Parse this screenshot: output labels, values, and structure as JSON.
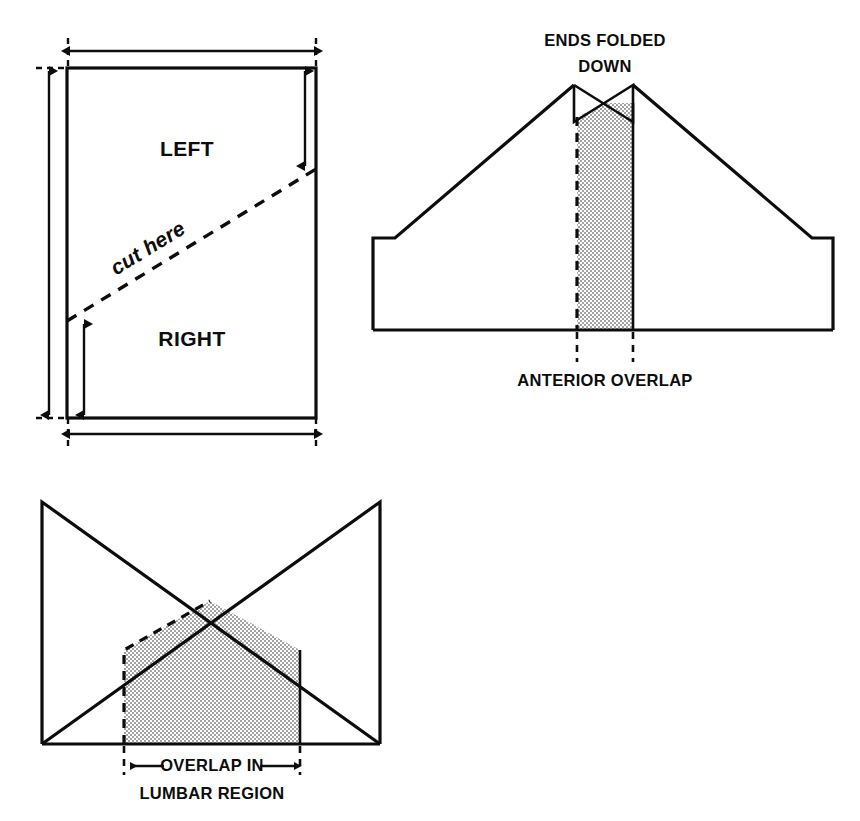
{
  "figure": {
    "background_color": "#ffffff",
    "ink_color": "#0d0d0d",
    "stipple_color": "#c9c9c9"
  },
  "panels": [
    {
      "id": "panel-sheet",
      "name": "rectangular-sheet-with-diagonal-cut",
      "labels": {
        "left": "LEFT",
        "right": "RIGHT",
        "cut": "cut here"
      },
      "dimensions": {
        "top_width_arrow": "double-headed horizontal arrow across top",
        "bottom_width_arrow": "double-headed horizontal arrow across bottom",
        "left_height_arrow": "double-headed vertical arrow full height",
        "left_short_arrow": "double-headed vertical arrow lower left",
        "right_short_arrow": "double-headed vertical arrow upper right"
      },
      "geometry": {
        "rect_left": 67,
        "rect_top": 68,
        "rect_right": 316,
        "rect_bottom": 418,
        "cut_start_x": 67,
        "cut_start_y": 321,
        "cut_end_x": 316,
        "cut_end_y": 169
      }
    },
    {
      "id": "panel-anterior",
      "name": "anterior-view-ends-folded-down",
      "labels": {
        "top": "ENDS FOLDED",
        "top_line2": "DOWN",
        "bottom": "ANTERIOR OVERLAP"
      },
      "geometry": {
        "body_left": 373,
        "body_right": 833,
        "body_bottom": 330,
        "shoulder_y": 238,
        "shoulder_left_x": 395,
        "shoulder_right_x": 812,
        "apex_left_x": 574,
        "apex_right_x": 633,
        "bowtie_top_y": 85,
        "bowtie_cross_y": 103,
        "bowtie_bottom_y": 122,
        "overlap_left_x": 577,
        "overlap_right_x": 633
      }
    },
    {
      "id": "panel-lumbar",
      "name": "posterior-view-overlap-in-lumbar-region",
      "labels": {
        "bottom_line1": "OVERLAP IN",
        "bottom_line2": "LUMBAR REGION"
      },
      "geometry": {
        "body_left": 42,
        "body_right": 380,
        "body_bottom": 744,
        "top_y": 502,
        "cross_x": 210,
        "cross_y": 601,
        "overlap_left_x": 124,
        "overlap_right_x": 300,
        "shoulder_y": 650
      }
    }
  ]
}
